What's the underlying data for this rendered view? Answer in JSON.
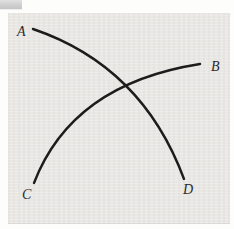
{
  "figure": {
    "colors": {
      "panel_bg": "#e9e8e4",
      "page_bg": "#fdfdfc",
      "curve_stroke": "#1c1c1c",
      "label_color": "#2b2b2b"
    },
    "curves": [
      {
        "name": "curve-a-to-d",
        "from": "A",
        "to": "D",
        "path": "M 33 29 Q 142 66 184 179"
      },
      {
        "name": "curve-c-to-b",
        "from": "C",
        "to": "B",
        "path": "M 34 183 Q 72 84 200 64"
      }
    ],
    "crossing_point": {
      "x": 127,
      "y": 88
    },
    "labels": [
      {
        "text": "A",
        "x": 17,
        "y": 36
      },
      {
        "text": "B",
        "x": 211,
        "y": 71
      },
      {
        "text": "C",
        "x": 22,
        "y": 199
      },
      {
        "text": "D",
        "x": 183,
        "y": 194
      }
    ]
  },
  "artifact": {
    "name": "window-fragment",
    "note": "small gray UI remnant at top-left corner"
  }
}
